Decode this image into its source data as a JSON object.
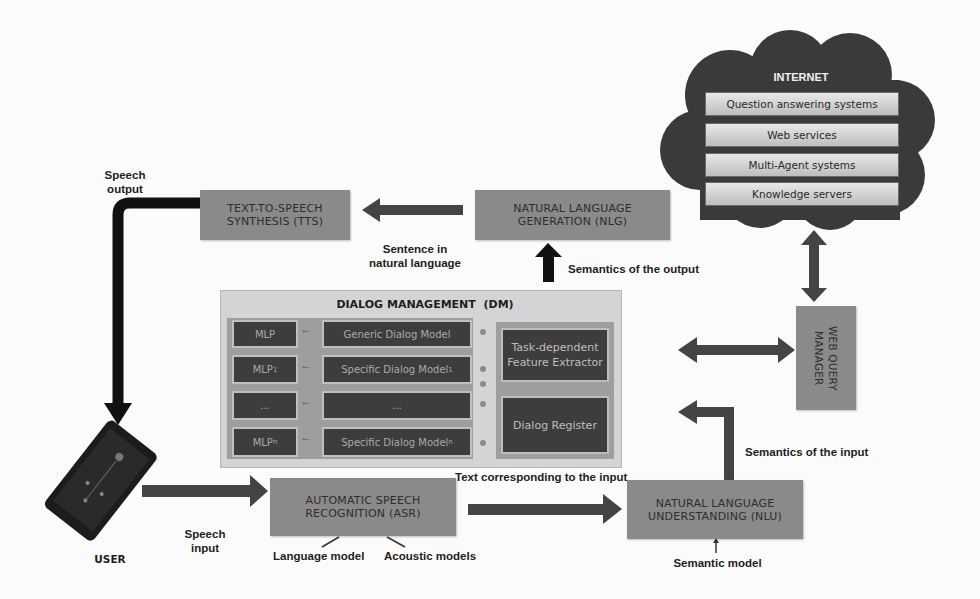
{
  "diagram": {
    "internet": {
      "title": "INTERNET",
      "items": [
        "Question answering systems",
        "Web services",
        "Multi-Agent systems",
        "Knowledge servers"
      ]
    },
    "tts": {
      "line1": "TEXT-TO-SPEECH",
      "line2": "SYNTHESIS (TTS)"
    },
    "nlg": {
      "line1": "NATURAL LANGUAGE",
      "line2": "GENERATION (NLG)"
    },
    "dm": {
      "title": "DIALOG MANAGEMENT  (DM)",
      "rows": [
        {
          "mlp": "MLP",
          "mlp_sub": "",
          "model": "Generic Dialog Model",
          "model_sub": ""
        },
        {
          "mlp": "MLP",
          "mlp_sub": "1",
          "model": "Specific Dialog Model",
          "model_sub": "1"
        },
        {
          "mlp": "...",
          "mlp_sub": "",
          "model": "...",
          "model_sub": ""
        },
        {
          "mlp": "MLP",
          "mlp_sub": "n",
          "model": "Specific Dialog Model",
          "model_sub": "n"
        }
      ],
      "feature_extractor": {
        "line1": "Task-dependent",
        "line2": "Feature Extractor"
      },
      "dialog_register": "Dialog Register"
    },
    "web_query_manager": {
      "line1": "WEB QUERY",
      "line2": "MANAGER"
    },
    "asr": {
      "line1": "AUTOMATIC SPEECH",
      "line2": "RECOGNITION (ASR)"
    },
    "nlu": {
      "line1": "NATURAL LANGUAGE",
      "line2": "UNDERSTANDING (NLU)"
    },
    "user_label": "USER",
    "labels": {
      "speech_output_1": "Speech",
      "speech_output_2": "output",
      "sentence_1": "Sentence in",
      "sentence_2": "natural language",
      "semantics_output": "Semantics of the output",
      "semantics_input": "Semantics of the input",
      "text_input": "Text corresponding to the input",
      "speech_input_1": "Speech",
      "speech_input_2": "input",
      "language_model": "Language model",
      "acoustic_models": "Acoustic models",
      "semantic_model": "Semantic model"
    },
    "colors": {
      "box_fill": "#8a8a8a",
      "dark_cell": "#3d3d3d",
      "arrow": "#3f3f3f",
      "cloud": "#3a3a3a",
      "background": "#fbfbfb"
    }
  }
}
